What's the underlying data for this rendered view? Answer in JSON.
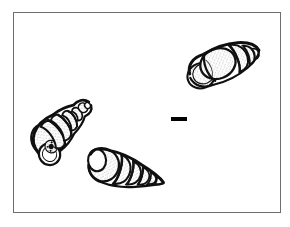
{
  "plate": {
    "title": "Gastropod shell plate",
    "background_color": "#ffffff",
    "frame": {
      "label": "illustration-frame",
      "border_color": "#6e6e72",
      "border_width_px": 1.5,
      "x": 13,
      "y": 12,
      "width": 268,
      "height": 201
    },
    "scale_bar": {
      "label": "scale-bar",
      "color": "#000000",
      "x": 171,
      "y": 117,
      "width": 16,
      "height": 4,
      "caption": ""
    },
    "ink_color": "#1a1a1a",
    "stipple_color": "#3a3a3a",
    "specimen_count": 3,
    "specimens": [
      {
        "id": "specimen-top-right",
        "name": "shell-top-right",
        "description": "elongate-ovate shell, aperture lower-left, spire to the right",
        "orientation_deg": -22,
        "center_x": 222,
        "center_y": 63,
        "length_px": 72,
        "width_px": 38,
        "whorl_count": 5
      },
      {
        "id": "specimen-left",
        "name": "shell-left",
        "description": "tall conical shell, apex upper-left, aperture and umbilicus lower-right",
        "orientation_deg": 52,
        "center_x": 62,
        "center_y": 128,
        "length_px": 74,
        "width_px": 36,
        "whorl_count": 6
      },
      {
        "id": "specimen-bottom-center",
        "name": "shell-bottom-center",
        "description": "turreted shell, body whorl left, tapering spire to the right",
        "orientation_deg": 16,
        "center_x": 127,
        "center_y": 172,
        "length_px": 76,
        "width_px": 36,
        "whorl_count": 6
      }
    ]
  }
}
